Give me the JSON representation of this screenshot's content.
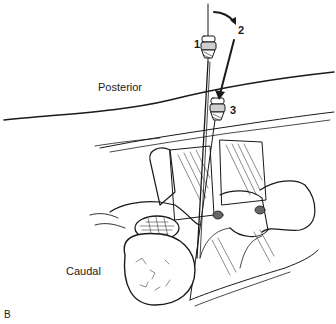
{
  "figure": {
    "panel_label": "B",
    "labels": {
      "posterior": "Posterior",
      "caudal": "Caudal"
    },
    "steps": [
      "1",
      "2",
      "3"
    ],
    "colors": {
      "ink": "#1a1a1a",
      "background": "#ffffff"
    }
  }
}
